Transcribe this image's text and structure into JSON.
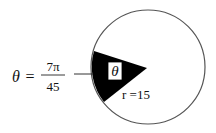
{
  "equation": {
    "lhs": "θ",
    "equals": "=",
    "numerator": "7π",
    "denominator": "45"
  },
  "sector_label": "θ",
  "radius_label": "r =15",
  "colors": {
    "sector_fill": "#000000",
    "circle_stroke": "#555555",
    "background": "#ffffff",
    "label_box": "#ffffff"
  }
}
